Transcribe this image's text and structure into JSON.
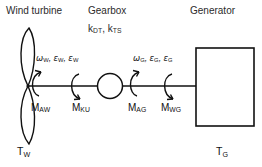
{
  "figure": {
    "type": "drivetrain-schematic",
    "background_color": "#ffffff",
    "stroke_color": "#111111"
  },
  "headers": {
    "wind_turbine": "Wind turbine",
    "gearbox": "Gearbox",
    "generator": "Generator"
  },
  "gearbox_stiffness": {
    "k1_symbol": "k",
    "k1_sub": "DT",
    "separator": ", ",
    "k2_symbol": "k",
    "k2_sub": "TS"
  },
  "kinematics": {
    "turbine": {
      "omega_symbol": "ω",
      "omega_sub": "W",
      "eps1_symbol": "ε",
      "eps1_sub": "W",
      "eps2_symbol": "ε",
      "eps2_sub": "W",
      "sep": ", "
    },
    "generator": {
      "omega_symbol": "ω",
      "omega_sub": "G",
      "eps1_symbol": "ε",
      "eps1_sub": "G",
      "eps2_symbol": "ε",
      "eps2_sub": "G",
      "sep": ", "
    }
  },
  "moments": [
    {
      "symbol": "M",
      "sub": "AW",
      "name": "moment-aw"
    },
    {
      "symbol": "M",
      "sub": "KU",
      "name": "moment-ku"
    },
    {
      "symbol": "M",
      "sub": "AG",
      "name": "moment-ag"
    },
    {
      "symbol": "M",
      "sub": "WG",
      "name": "moment-wg"
    }
  ],
  "torques": {
    "turbine": {
      "symbol": "T",
      "sub": "W"
    },
    "generator": {
      "symbol": "T",
      "sub": "G"
    }
  },
  "components": {
    "rotor": "wind-turbine-rotor",
    "shaft": "drive-shaft",
    "gearbox_circle": "gearbox-node",
    "generator_box": "generator-body"
  }
}
